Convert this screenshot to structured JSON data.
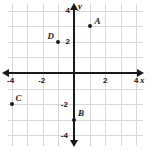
{
  "chart_data": {
    "type": "scatter",
    "title": "",
    "xlabel": "x",
    "ylabel": "y",
    "xlim": [
      -5.2,
      5.2
    ],
    "ylim": [
      -5.2,
      5.2
    ],
    "grid": true,
    "grid_step": 1,
    "legend": "none",
    "x_tick_labels": [
      "-4",
      "-2",
      "2",
      "4"
    ],
    "x_tick_values": [
      -4,
      -2,
      2,
      4
    ],
    "y_tick_labels": [
      "4",
      "2",
      "-2",
      "-4"
    ],
    "y_tick_values": [
      4,
      2,
      -2,
      -4
    ],
    "points": [
      {
        "name": "A",
        "x": 1,
        "y": 3,
        "label_dx": 5,
        "label_dy": -9
      },
      {
        "name": "B",
        "x": 0,
        "y": -3,
        "label_dx": 4,
        "label_dy": -11
      },
      {
        "name": "C",
        "x": -4,
        "y": -2,
        "label_dx": 4,
        "label_dy": -10
      },
      {
        "name": "D",
        "x": -1,
        "y": 2,
        "label_dx": -11,
        "label_dy": -10
      }
    ]
  },
  "colors": {
    "axis": "#1a1a1a",
    "grid": "#d8d8d8",
    "point": "#1a1a1a",
    "background": "#ffffff"
  }
}
